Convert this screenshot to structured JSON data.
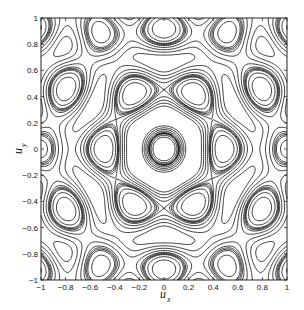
{
  "chart_data": {
    "type": "contour",
    "title": "",
    "xlabel": "u_x",
    "ylabel": "u_y",
    "xlim": [
      -1,
      1
    ],
    "ylim": [
      -1,
      1
    ],
    "grid": false,
    "legend": null,
    "x_ticks": [
      -1,
      -0.8,
      -0.6,
      -0.4,
      -0.2,
      0,
      0.2,
      0.4,
      0.6,
      0.8,
      1
    ],
    "x_tick_labels": [
      "-1",
      "-0.8",
      "-0.6",
      "-0.4",
      "-0.2",
      "0",
      "0.2",
      "0.4",
      "0.6",
      "0.8",
      "1"
    ],
    "y_ticks": [
      -1,
      -0.8,
      -0.6,
      -0.4,
      -0.2,
      0,
      0.2,
      0.4,
      0.6,
      0.8,
      1
    ],
    "y_tick_labels": [
      "-1",
      "-0.8",
      "-0.6",
      "-0.4",
      "-0.2",
      "0",
      "0.2",
      "0.4",
      "0.6",
      "0.8",
      "1"
    ],
    "features": {
      "symmetry": "6-fold",
      "central_lobe_radius": 0.25,
      "ring_radii": [
        0.3,
        0.35,
        0.45,
        0.55
      ],
      "peripheral_lobes": 12
    }
  },
  "axes": {
    "x_label_main": "u",
    "x_label_sub": "x",
    "y_label_main": "u",
    "y_label_sub": "y"
  },
  "style": {
    "line_color": "#111111",
    "background": "#ffffff"
  }
}
